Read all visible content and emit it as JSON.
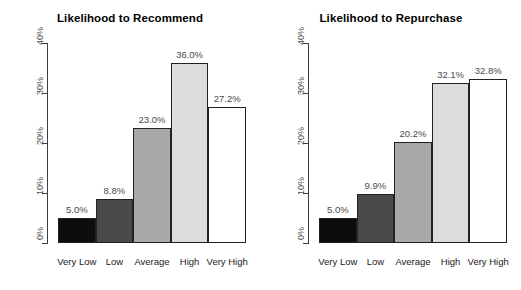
{
  "chart_data": [
    {
      "type": "bar",
      "title": "Likelihood to Recommend",
      "xlabel": "",
      "ylabel": "",
      "ylim": [
        0,
        40
      ],
      "ytick_labels": [
        "0%",
        "10%",
        "20%",
        "30%",
        "40%"
      ],
      "ytick_values": [
        0,
        10,
        20,
        30,
        40
      ],
      "grid": false,
      "legend": "none",
      "categories": [
        "Very Low",
        "Low",
        "Average",
        "High",
        "Very High"
      ],
      "values": [
        5.0,
        8.8,
        23.0,
        36.0,
        27.2
      ],
      "value_labels": [
        "5.0%",
        "8.8%",
        "23.0%",
        "36.0%",
        "27.2%"
      ],
      "bar_colors": [
        "#0d0d0d",
        "#4a4a4a",
        "#a8a8a8",
        "#dcdcdc",
        "#ffffff"
      ]
    },
    {
      "type": "bar",
      "title": "Likelihood to Repurchase",
      "xlabel": "",
      "ylabel": "",
      "ylim": [
        0,
        40
      ],
      "ytick_labels": [
        "0%",
        "10%",
        "20%",
        "30%",
        "40%"
      ],
      "ytick_values": [
        0,
        10,
        20,
        30,
        40
      ],
      "grid": false,
      "legend": "none",
      "categories": [
        "Very Low",
        "Low",
        "Average",
        "High",
        "Very High"
      ],
      "values": [
        5.0,
        9.9,
        20.2,
        32.1,
        32.8
      ],
      "value_labels": [
        "5.0%",
        "9.9%",
        "20.2%",
        "32.1%",
        "32.8%"
      ],
      "bar_colors": [
        "#0d0d0d",
        "#4a4a4a",
        "#a8a8a8",
        "#dcdcdc",
        "#ffffff"
      ]
    }
  ]
}
